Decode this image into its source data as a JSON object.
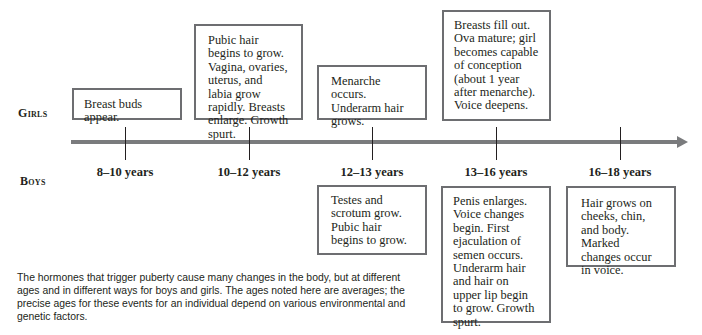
{
  "diagram": {
    "row_labels": {
      "girls": "Girls",
      "boys": "Boys"
    },
    "timeline": {
      "ages": [
        "8–10 years",
        "10–12 years",
        "12–13 years",
        "13–16 years",
        "16–18 years"
      ]
    },
    "girls": [
      {
        "age": "8–10 years",
        "text": "Breast buds appear."
      },
      {
        "age": "10–12 years",
        "text": "Pubic hair begins to grow. Vagina, ovaries, uterus, and labia grow rapidly. Breasts enlarge. Growth spurt."
      },
      {
        "age": "12–13 years",
        "text": "Menarche occurs. Underarm hair grows."
      },
      {
        "age": "13–16 years",
        "text": "Breasts fill out. Ova mature; girl becomes capable of conception (about 1 year after menarche). Voice deepens."
      }
    ],
    "boys": [
      {
        "age": "12–13 years",
        "text": "Testes and scrotum grow. Pubic hair begins to grow."
      },
      {
        "age": "13–16 years",
        "text": "Penis enlarges. Voice changes begin. First ejaculation of semen occurs. Underarm hair and hair on upper lip begin to grow. Growth spurt."
      },
      {
        "age": "16–18 years",
        "text": "Hair grows on cheeks, chin, and body. Marked changes occur in voice."
      }
    ],
    "caption": "The hormones that trigger puberty cause many changes in the body, but at different ages and in different ways for boys and girls. The ages noted here are averages; the precise ages for these events for an individual depend on various environmental and genetic factors."
  },
  "colors": {
    "box_border": "#6d6e71",
    "timeline_bar": "#7a7b7d",
    "text": "#231f20"
  }
}
